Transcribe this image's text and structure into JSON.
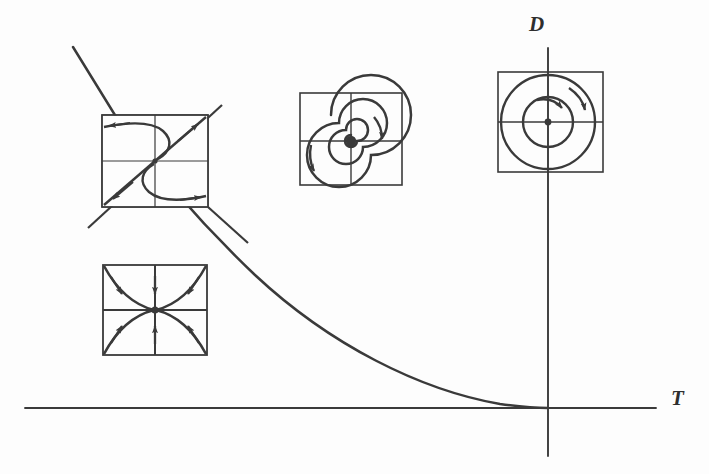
{
  "figure": {
    "type": "diagram",
    "background_color": "#fdfdfd",
    "stroke_color": "#3a3a3a",
    "width": 709,
    "height": 474
  },
  "axes": {
    "horizontal": {
      "label": "T",
      "name": "trace-axis",
      "x1": 25,
      "y1": 408,
      "x2": 656,
      "y2": 408
    },
    "vertical": {
      "label": "D",
      "name": "determinant-axis",
      "x1": 548,
      "y1": 48,
      "x2": 548,
      "y2": 456
    },
    "origin": {
      "x": 548,
      "y": 408
    }
  },
  "parabola": {
    "name": "discriminant-parabola",
    "equation": "D = T^2 / 4",
    "description": "Curve descending from upper left, tangent to the T axis at the origin",
    "path": "M 73,47 L 118,120 C 150,163 195,218 255,275 C 330,345 420,390 500,404 C 522,407 538,408 548,408"
  },
  "insets": [
    {
      "name": "saddle-inset",
      "kind": "saddle",
      "box": {
        "x": 102,
        "y": 115,
        "width": 106,
        "height": 92
      },
      "has_crosshair": true,
      "arrow_count": 4,
      "extends_outside": true
    },
    {
      "name": "node-inset",
      "kind": "node",
      "box": {
        "x": 103,
        "y": 265,
        "width": 104,
        "height": 90
      },
      "has_crosshair": true,
      "arrow_count": 6,
      "extends_outside": false
    },
    {
      "name": "spiral-inset",
      "kind": "spiral",
      "box": {
        "x": 300,
        "y": 93,
        "width": 102,
        "height": 92
      },
      "has_crosshair": true,
      "arrow_count": 2,
      "extends_outside": false
    },
    {
      "name": "center-inset",
      "kind": "center",
      "box": {
        "x": 498,
        "y": 72,
        "width": 105,
        "height": 100
      },
      "has_crosshair": true,
      "arrow_count": 2,
      "extends_outside": false
    }
  ]
}
